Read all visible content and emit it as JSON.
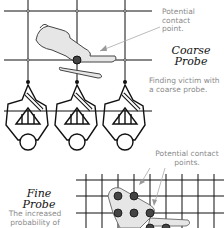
{
  "coarse": {
    "callout": "Potential contact point.",
    "callout_lines": [
      "Potential",
      "contact",
      "point."
    ],
    "title_lines": [
      "Coarse",
      "Probe"
    ],
    "caption_lines": [
      "Finding victim with",
      "a coarse probe."
    ]
  },
  "fine": {
    "callout_lines": [
      "Potential contact",
      "points."
    ],
    "title_lines": [
      "Fine",
      "Probe"
    ],
    "caption_lines": [
      "The increased",
      "probability of"
    ]
  },
  "colors": {
    "line": "#111111",
    "label_gray": "#8a8a8a",
    "probe_dot": "#444444",
    "victim_fill": "#e4e4e4"
  }
}
